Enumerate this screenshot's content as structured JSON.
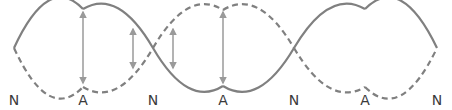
{
  "diagram": {
    "type": "standing-wave",
    "colors": {
      "wave": "#808080",
      "arrow": "#9a9a9a",
      "label": "#3a3a3a",
      "background": "#ffffff"
    },
    "wave_solid": {
      "description": "standing wave at one extreme (solid line)",
      "style": "solid"
    },
    "wave_dashed": {
      "description": "standing wave at opposite extreme (dashed line)",
      "style": "dashed"
    },
    "labels": [
      {
        "text": "N",
        "x": 14,
        "meaning": "node"
      },
      {
        "text": "A",
        "x": 83,
        "meaning": "antinode"
      },
      {
        "text": "N",
        "x": 153,
        "meaning": "node"
      },
      {
        "text": "A",
        "x": 223,
        "meaning": "antinode"
      },
      {
        "text": "N",
        "x": 294,
        "meaning": "node"
      },
      {
        "text": "A",
        "x": 365,
        "meaning": "antinode"
      },
      {
        "text": "N",
        "x": 437,
        "meaning": "node"
      }
    ],
    "arrows": [
      {
        "x": 83,
        "y1": 12,
        "y2": 83,
        "meaning": "amplitude at antinode"
      },
      {
        "x": 133,
        "y1": 29,
        "y2": 68,
        "meaning": "amplitude near node"
      },
      {
        "x": 173,
        "y1": 29,
        "y2": 68,
        "meaning": "amplitude near node"
      },
      {
        "x": 223,
        "y1": 12,
        "y2": 83,
        "meaning": "amplitude at antinode"
      }
    ]
  }
}
